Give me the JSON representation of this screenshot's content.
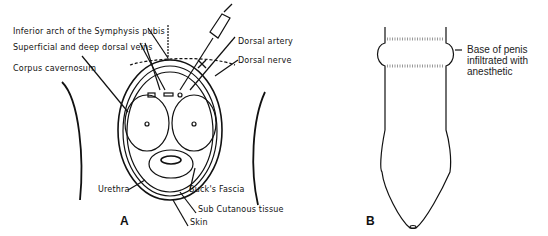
{
  "figure": {
    "panel_a": {
      "letter": "A",
      "labels": {
        "symphysis": "Inferior arch of the Symphysis pubis",
        "veins": "Superficial and deep dorsal veins",
        "corpus": "Corpus cavernosum",
        "artery": "Dorsal artery",
        "nerve": "Dorsal nerve",
        "urethra": "Urethra",
        "bucks": "Buck's Fascia",
        "subcut": "Sub Cutanous tissue",
        "skin": "Skin"
      }
    },
    "panel_b": {
      "letter": "B",
      "label_lines": [
        "Base of penis",
        "infiltrated with",
        "anesthetic"
      ]
    }
  }
}
